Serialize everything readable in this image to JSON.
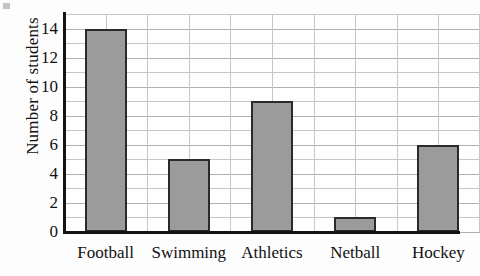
{
  "chart_data": {
    "type": "bar",
    "title": "",
    "xlabel": "",
    "ylabel": "Number of students",
    "categories": [
      "Football",
      "Swimming",
      "Athletics",
      "Netball",
      "Hockey"
    ],
    "values": [
      14,
      5,
      9,
      1,
      6
    ],
    "ylim": [
      0,
      15
    ],
    "ytick_labels": [
      "0",
      "2",
      "4",
      "6",
      "8",
      "10",
      "12",
      "14"
    ],
    "ytick_values": [
      0,
      2,
      4,
      6,
      8,
      10,
      12,
      14
    ],
    "grid": true,
    "legend": null,
    "bar_fill_color": "#9b9b9b",
    "bar_edge_color": "#2a2a2a",
    "axis_color": "#141414",
    "grid_color": "#c6c6c6"
  }
}
